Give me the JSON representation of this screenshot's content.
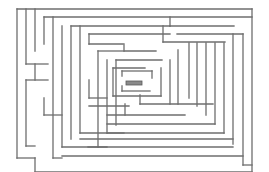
{
  "maze": {
    "width": 269,
    "height": 172,
    "wall_color": "#6e6e6e",
    "goal_color": "#8a8a8a",
    "goal": {
      "x": 126,
      "y": 81,
      "w": 16,
      "h": 4
    },
    "walls": [
      [
        17,
        9,
        252,
        9
      ],
      [
        17,
        9,
        17,
        158
      ],
      [
        17,
        158,
        35,
        158
      ],
      [
        35,
        158,
        35,
        172
      ],
      [
        35,
        172,
        252,
        172
      ],
      [
        26,
        9,
        26,
        64
      ],
      [
        26,
        64,
        48,
        64
      ],
      [
        35,
        9,
        35,
        51
      ],
      [
        35,
        64,
        35,
        80
      ],
      [
        26,
        80,
        48,
        80
      ],
      [
        26,
        80,
        26,
        146
      ],
      [
        26,
        146,
        35,
        146
      ],
      [
        44,
        17,
        44,
        44
      ],
      [
        44,
        17,
        252,
        17
      ],
      [
        53,
        17,
        53,
        158
      ],
      [
        53,
        158,
        62,
        158
      ],
      [
        62,
        26,
        62,
        147
      ],
      [
        62,
        147,
        107,
        147
      ],
      [
        71,
        26,
        71,
        139
      ],
      [
        71,
        26,
        170,
        26
      ],
      [
        80,
        26,
        80,
        133
      ],
      [
        89,
        34,
        89,
        44
      ],
      [
        89,
        44,
        123,
        44
      ],
      [
        89,
        34,
        170,
        34
      ],
      [
        98,
        51,
        123,
        51
      ],
      [
        98,
        51,
        98,
        147
      ],
      [
        107,
        60,
        107,
        133
      ],
      [
        107,
        133,
        124,
        133
      ],
      [
        116,
        60,
        162,
        60
      ],
      [
        116,
        60,
        116,
        125
      ],
      [
        124,
        44,
        124,
        51
      ],
      [
        124,
        51,
        156,
        51
      ],
      [
        163,
        26,
        163,
        42
      ],
      [
        163,
        42,
        225,
        42
      ],
      [
        170,
        17,
        170,
        26
      ],
      [
        170,
        26,
        234,
        26
      ],
      [
        177,
        34,
        243,
        34
      ],
      [
        243,
        34,
        243,
        165
      ],
      [
        243,
        165,
        252,
        165
      ],
      [
        252,
        9,
        252,
        172
      ],
      [
        122,
        71,
        152,
        71
      ],
      [
        122,
        71,
        122,
        76
      ],
      [
        152,
        71,
        152,
        78
      ],
      [
        122,
        91,
        150,
        91
      ],
      [
        122,
        86,
        122,
        91
      ],
      [
        161,
        68,
        161,
        96
      ],
      [
        113,
        96,
        161,
        96
      ],
      [
        113,
        68,
        113,
        96
      ],
      [
        113,
        68,
        145,
        68
      ],
      [
        89,
        106,
        129,
        106
      ],
      [
        107,
        115,
        185,
        115
      ],
      [
        125,
        104,
        125,
        115
      ],
      [
        140,
        95,
        140,
        104
      ],
      [
        140,
        104,
        213,
        104
      ],
      [
        170,
        60,
        170,
        104
      ],
      [
        178,
        50,
        178,
        104
      ],
      [
        189,
        43,
        189,
        98
      ],
      [
        197,
        43,
        197,
        106
      ],
      [
        206,
        43,
        206,
        115
      ],
      [
        215,
        43,
        215,
        124
      ],
      [
        224,
        43,
        224,
        133
      ],
      [
        233,
        34,
        233,
        144
      ],
      [
        107,
        124,
        215,
        124
      ],
      [
        80,
        133,
        224,
        133
      ],
      [
        80,
        139,
        233,
        139
      ],
      [
        88,
        147,
        233,
        147
      ],
      [
        62,
        156,
        243,
        156
      ],
      [
        44,
        115,
        62,
        115
      ],
      [
        44,
        98,
        44,
        115
      ],
      [
        89,
        80,
        89,
        98
      ],
      [
        89,
        98,
        107,
        98
      ]
    ]
  }
}
